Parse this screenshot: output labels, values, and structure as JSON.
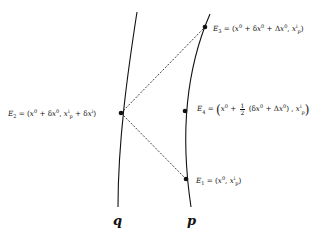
{
  "diagram": {
    "type": "spacetime-worldlines",
    "curves": [
      {
        "id": "q",
        "label": "q",
        "path": "M137,12 C128,70 118,140 118,207"
      },
      {
        "id": "p",
        "label": "p",
        "path": "M210,14 C190,60 178,120 191,207"
      }
    ],
    "events": [
      {
        "id": "E1",
        "x": 186,
        "y": 179,
        "label": "E₁ = (x⁰, x_pⁱ)"
      },
      {
        "id": "E2",
        "x": 121,
        "y": 113,
        "label": "E₂ = (x⁰ + δx⁰, x_pⁱ + δxⁱ)"
      },
      {
        "id": "E3",
        "x": 205,
        "y": 27,
        "label": "E₃ = (x⁰ + δx⁰ + Δx⁰, x_pⁱ)"
      },
      {
        "id": "E4",
        "x": 185,
        "y": 111,
        "label": "E₄ = (x⁰ + ½(δx⁰ + Δx⁰), x_pⁱ)"
      }
    ],
    "dashed_lines": [
      {
        "from": "E2",
        "to": "E3"
      },
      {
        "from": "E2",
        "to": "E1"
      }
    ],
    "colors": {
      "line": "#111111",
      "background": "#ffffff"
    }
  },
  "labels": {
    "E1": {
      "name": "E",
      "sub": "1",
      "eq": "=",
      "x0": "x",
      "sup0": "0",
      "xi": "x",
      "supi": "i",
      "subp": "p"
    },
    "E2": {
      "name": "E",
      "sub": "2",
      "eq": "=",
      "delta": "δ",
      "plus": "+"
    },
    "E3": {
      "name": "E",
      "sub": "3",
      "eq": "=",
      "Delta": "Δ"
    },
    "E4": {
      "name": "E",
      "sub": "4",
      "eq": "=",
      "frac_num": "1",
      "frac_den": "2"
    },
    "q": "q",
    "p": "p"
  }
}
